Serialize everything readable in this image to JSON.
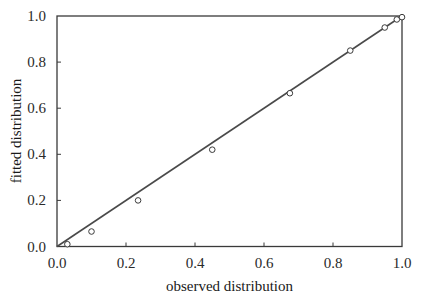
{
  "chart_data": {
    "type": "scatter",
    "title": "",
    "xlabel": "observed distribution",
    "ylabel": "fitted distribution",
    "xlim": [
      0.0,
      1.0
    ],
    "ylim": [
      0.0,
      1.0
    ],
    "xticks": [
      "0.0",
      "0.2",
      "0.4",
      "0.6",
      "0.8",
      "1.0"
    ],
    "yticks": [
      "0.0",
      "0.2",
      "0.4",
      "0.6",
      "0.8",
      "1.0"
    ],
    "grid": false,
    "legend": null,
    "series": [
      {
        "name": "data points",
        "marker": "open-circle",
        "points": [
          {
            "x": 0.03,
            "y": 0.01
          },
          {
            "x": 0.1,
            "y": 0.065
          },
          {
            "x": 0.235,
            "y": 0.2
          },
          {
            "x": 0.45,
            "y": 0.42
          },
          {
            "x": 0.675,
            "y": 0.665
          },
          {
            "x": 0.85,
            "y": 0.85
          },
          {
            "x": 0.95,
            "y": 0.95
          },
          {
            "x": 0.985,
            "y": 0.985
          },
          {
            "x": 1.0,
            "y": 0.995
          }
        ]
      },
      {
        "name": "fitted line",
        "type": "line",
        "points": [
          {
            "x": 0.0,
            "y": 0.0
          },
          {
            "x": 1.0,
            "y": 1.0
          }
        ]
      }
    ]
  },
  "colors": {
    "axis": "#3a3a3a",
    "line": "#4a4a4a",
    "marker_stroke": "#3a3a3a",
    "marker_fill": "#ffffff"
  }
}
